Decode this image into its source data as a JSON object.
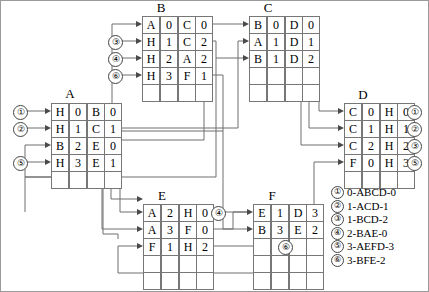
{
  "diagram": {
    "tables": [
      {
        "id": "A",
        "name": "A",
        "rows": [
          {
            "c0": "H",
            "c1": "0",
            "c2": "B",
            "c3": "0"
          },
          {
            "c0": "H",
            "c1": "1",
            "c2": "C",
            "c3": "1"
          },
          {
            "c0": "B",
            "c1": "2",
            "c2": "E",
            "c3": "0"
          },
          {
            "c0": "H",
            "c1": "3",
            "c2": "E",
            "c3": "1"
          },
          {
            "c0": "",
            "c1": "",
            "c2": "",
            "c3": ""
          }
        ]
      },
      {
        "id": "B",
        "name": "B",
        "rows": [
          {
            "c0": "A",
            "c1": "0",
            "c2": "C",
            "c3": "0"
          },
          {
            "c0": "H",
            "c1": "1",
            "c2": "C",
            "c3": "2"
          },
          {
            "c0": "H",
            "c1": "2",
            "c2": "A",
            "c3": "2"
          },
          {
            "c0": "H",
            "c1": "3",
            "c2": "F",
            "c3": "1"
          },
          {
            "c0": "",
            "c1": "",
            "c2": "",
            "c3": ""
          }
        ]
      },
      {
        "id": "C",
        "name": "C",
        "rows": [
          {
            "c0": "B",
            "c1": "0",
            "c2": "D",
            "c3": "0"
          },
          {
            "c0": "A",
            "c1": "1",
            "c2": "D",
            "c3": "1"
          },
          {
            "c0": "B",
            "c1": "1",
            "c2": "D",
            "c3": "2"
          },
          {
            "c0": "",
            "c1": "",
            "c2": "",
            "c3": ""
          },
          {
            "c0": "",
            "c1": "",
            "c2": "",
            "c3": ""
          }
        ]
      },
      {
        "id": "D",
        "name": "D",
        "rows": [
          {
            "c0": "C",
            "c1": "0",
            "c2": "H",
            "c3": "0"
          },
          {
            "c0": "C",
            "c1": "1",
            "c2": "H",
            "c3": "1"
          },
          {
            "c0": "C",
            "c1": "2",
            "c2": "H",
            "c3": "2"
          },
          {
            "c0": "F",
            "c1": "0",
            "c2": "H",
            "c3": "3"
          },
          {
            "c0": "",
            "c1": "",
            "c2": "",
            "c3": ""
          }
        ]
      },
      {
        "id": "E",
        "name": "E",
        "rows": [
          {
            "c0": "A",
            "c1": "2",
            "c2": "H",
            "c3": "0"
          },
          {
            "c0": "A",
            "c1": "3",
            "c2": "F",
            "c3": "0"
          },
          {
            "c0": "F",
            "c1": "1",
            "c2": "H",
            "c3": "2"
          },
          {
            "c0": "",
            "c1": "",
            "c2": "",
            "c3": ""
          },
          {
            "c0": "",
            "c1": "",
            "c2": "",
            "c3": ""
          }
        ]
      },
      {
        "id": "F",
        "name": "F",
        "rows": [
          {
            "c0": "E",
            "c1": "1",
            "c2": "D",
            "c3": "3"
          },
          {
            "c0": "B",
            "c1": "3",
            "c2": "E",
            "c3": "2"
          },
          {
            "c0": "",
            "c1": "",
            "c2": "",
            "c3": ""
          },
          {
            "c0": "",
            "c1": "",
            "c2": "",
            "c3": ""
          },
          {
            "c0": "",
            "c1": "",
            "c2": "",
            "c3": ""
          }
        ]
      }
    ],
    "markers": {
      "b_in_3": "③",
      "b_in_4": "④",
      "b_in_6": "⑥",
      "a_in_1": "①",
      "a_in_2": "②",
      "a_in_5": "⑤",
      "d_out_1": "①",
      "d_out_2": "②",
      "d_out_3": "③",
      "d_out_5": "⑤",
      "e_out_4": "④",
      "e_out_6": "⑥"
    },
    "legend": [
      {
        "mark": "①",
        "text": "0-ABCD-0"
      },
      {
        "mark": "②",
        "text": "1-ACD-1"
      },
      {
        "mark": "③",
        "text": "1-BCD-2"
      },
      {
        "mark": "④",
        "text": "2-BAE-0"
      },
      {
        "mark": "⑤",
        "text": "3-AEFD-3"
      },
      {
        "mark": "⑥",
        "text": "3-BFE-2"
      }
    ],
    "colors": {
      "line": "#6f6f6f",
      "border": "#777777",
      "background": "#ffffff",
      "text": "#000000"
    }
  }
}
